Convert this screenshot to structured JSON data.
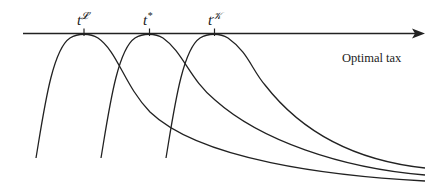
{
  "diagram": {
    "axis": {
      "label": "Optimal tax",
      "direction": "right"
    },
    "ticks": [
      {
        "id": "tL",
        "base": "t",
        "superscript": "𝓛"
      },
      {
        "id": "tstar",
        "base": "t",
        "superscript": "*"
      },
      {
        "id": "tK",
        "base": "t",
        "superscript": "𝒦"
      }
    ],
    "curves": [
      {
        "name": "curve-L",
        "peak_at": "tL"
      },
      {
        "name": "curve-star",
        "peak_at": "tstar"
      },
      {
        "name": "curve-K",
        "peak_at": "tK"
      }
    ],
    "colors": {
      "line": "#222222",
      "background": "#ffffff"
    }
  }
}
